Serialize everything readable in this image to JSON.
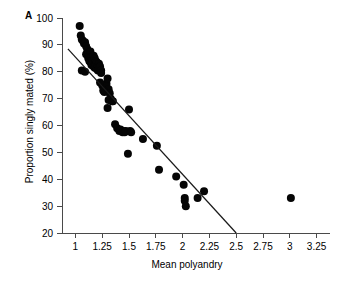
{
  "figure": {
    "panel_label": "A"
  },
  "chart_data": {
    "type": "scatter",
    "title": "",
    "xlabel": "Mean polyandry",
    "ylabel": "Proportion singly mated (%)",
    "xlim": [
      0.875,
      3.375
    ],
    "ylim": [
      20,
      100
    ],
    "xticks": [
      1,
      1.25,
      1.5,
      1.75,
      2,
      2.25,
      2.5,
      2.75,
      3,
      3.25
    ],
    "xticklabels": [
      "1",
      "1.25",
      "1.5",
      "1.75",
      "2",
      "2.25",
      "2.5",
      "2.75",
      "3",
      "3.25"
    ],
    "yticks": [
      20,
      30,
      40,
      50,
      60,
      70,
      80,
      90,
      100
    ],
    "yticklabels": [
      "20",
      "30",
      "40",
      "50",
      "60",
      "70",
      "80",
      "90",
      "100"
    ],
    "grid": false,
    "legend": null,
    "marker_color": "#050505",
    "line_color": "#1a1a1a",
    "series": [
      {
        "name": "Species",
        "marker": "filled-circle",
        "x": [
          1.04,
          1.05,
          1.06,
          1.07,
          1.08,
          1.09,
          1.1,
          1.1,
          1.11,
          1.12,
          1.12,
          1.13,
          1.13,
          1.14,
          1.14,
          1.15,
          1.15,
          1.16,
          1.16,
          1.17,
          1.17,
          1.18,
          1.18,
          1.19,
          1.19,
          1.2,
          1.2,
          1.21,
          1.21,
          1.22,
          1.22,
          1.23,
          1.24,
          1.24,
          1.25,
          1.26,
          1.27,
          1.28,
          1.29,
          1.3,
          1.31,
          1.32,
          1.33,
          1.34,
          1.06,
          1.09,
          1.23,
          1.26,
          1.3,
          1.31,
          1.35,
          1.37,
          1.39,
          1.41,
          1.42,
          1.44,
          1.45,
          1.46,
          1.47,
          1.49,
          1.5,
          1.51,
          1.52,
          1.63,
          1.76,
          1.78,
          1.94,
          2.01,
          2.02,
          2.02,
          2.03,
          2.14,
          2.2,
          3.01
        ],
        "y": [
          97.0,
          93.5,
          92.0,
          91.5,
          90.5,
          91.0,
          89.5,
          86.5,
          88.5,
          87.0,
          85.0,
          86.0,
          84.0,
          87.5,
          83.5,
          85.5,
          82.5,
          84.5,
          83.0,
          86.0,
          82.0,
          85.0,
          81.5,
          84.0,
          82.5,
          83.5,
          81.0,
          82.0,
          80.5,
          83.0,
          81.5,
          82.0,
          80.5,
          79.5,
          75.0,
          74.5,
          72.5,
          74.0,
          75.5,
          77.5,
          73.5,
          72.0,
          70.0,
          69.0,
          80.5,
          80.0,
          76.0,
          73.0,
          66.5,
          69.5,
          69.0,
          60.5,
          59.0,
          58.0,
          58.5,
          57.5,
          58.0,
          57.5,
          58.0,
          49.5,
          66.0,
          58.0,
          57.5,
          55.0,
          52.5,
          43.5,
          41.0,
          38.0,
          33.0,
          32.0,
          30.0,
          33.0,
          35.5,
          33.0
        ]
      }
    ],
    "fit_line": {
      "name": "regression-line",
      "x_start": 0.93,
      "y_start": 88.5,
      "x_end": 2.5,
      "y_end": 20.0
    }
  }
}
